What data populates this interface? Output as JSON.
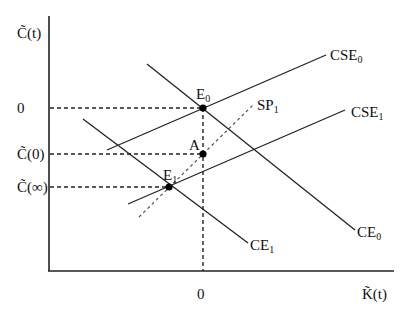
{
  "diagram": {
    "axes": {
      "y_label": "C̃(t)",
      "x_label": "K̃(t)",
      "y_ticks": [
        {
          "label": "0",
          "y": 108
        },
        {
          "label": "C̃(0)",
          "y": 154
        },
        {
          "label": "C̃(∞)",
          "y": 187
        }
      ],
      "x_ticks": [
        {
          "label": "0",
          "x": 203
        }
      ]
    },
    "curves": [
      {
        "name": "CSE",
        "sub": "0",
        "type": "solid",
        "from": [
          107,
          150
        ],
        "to": [
          326,
          55
        ]
      },
      {
        "name": "CSE",
        "sub": "1",
        "type": "solid",
        "from": [
          128,
          204
        ],
        "to": [
          345,
          110
        ]
      },
      {
        "name": "CE",
        "sub": "0",
        "type": "solid",
        "from": [
          147,
          64
        ],
        "to": [
          355,
          230
        ]
      },
      {
        "name": "CE",
        "sub": "1",
        "type": "solid",
        "from": [
          83,
          119
        ],
        "to": [
          248,
          243
        ]
      },
      {
        "name": "SP",
        "sub": "1",
        "type": "dotted",
        "from": [
          139,
          217
        ],
        "to": [
          253,
          105
        ]
      }
    ],
    "points": [
      {
        "name": "E",
        "sub": "0",
        "x": 203,
        "y": 108
      },
      {
        "name": "A",
        "sub": "",
        "x": 203,
        "y": 154
      },
      {
        "name": "E",
        "sub": "1",
        "x": 169,
        "y": 187
      }
    ],
    "labels": {
      "cse0": "CSE",
      "cse0_sub": "0",
      "cse1": "CSE",
      "cse1_sub": "1",
      "ce0": "CE",
      "ce0_sub": "0",
      "ce1": "CE",
      "ce1_sub": "1",
      "sp1": "SP",
      "sp1_sub": "1",
      "e0": "E",
      "e0_sub": "0",
      "e1": "E",
      "e1_sub": "1",
      "a": "A",
      "y_tick_0": "0",
      "y_tick_c0": "C̃(0)",
      "y_tick_cinf": "C̃(∞)",
      "x_tick_0": "0",
      "y_axis": "C̃(t)",
      "x_axis": "K̃(t)"
    }
  }
}
